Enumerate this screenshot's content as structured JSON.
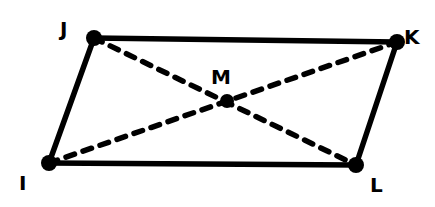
{
  "figure": {
    "type": "parallelogram-with-diagonals",
    "colors": {
      "background": "#ffffff",
      "stroke": "#000000"
    },
    "points": {
      "J": {
        "label": "J",
        "x": 94,
        "y": 38,
        "label_x": 60,
        "label_y": 36
      },
      "K": {
        "label": "K",
        "x": 397,
        "y": 42,
        "label_x": 404,
        "label_y": 44
      },
      "I": {
        "label": "I",
        "x": 49,
        "y": 163,
        "label_x": 19,
        "label_y": 190
      },
      "L": {
        "label": "L",
        "x": 356,
        "y": 165,
        "label_x": 370,
        "label_y": 192
      },
      "M": {
        "label": "M",
        "x": 227,
        "y": 101,
        "label_x": 211,
        "label_y": 84
      }
    },
    "sides": [
      {
        "from": "J",
        "to": "K",
        "style": "solid"
      },
      {
        "from": "K",
        "to": "L",
        "style": "solid"
      },
      {
        "from": "L",
        "to": "I",
        "style": "solid"
      },
      {
        "from": "I",
        "to": "J",
        "style": "solid"
      }
    ],
    "diagonals": [
      {
        "from": "J",
        "to": "L",
        "style": "dashed"
      },
      {
        "from": "I",
        "to": "K",
        "style": "dashed"
      }
    ]
  }
}
